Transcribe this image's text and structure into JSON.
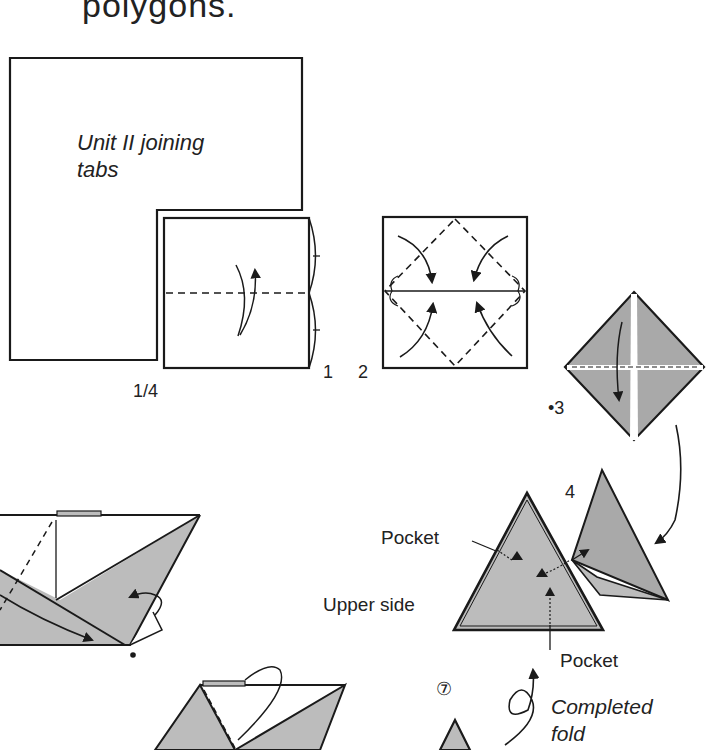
{
  "header": {
    "title_fragment": "polygons."
  },
  "steps": [
    {
      "id": "1/4",
      "label": "1/4"
    },
    {
      "id": "1",
      "label": "1"
    },
    {
      "id": "2",
      "label": "2"
    },
    {
      "id": "3",
      "label": "•3"
    },
    {
      "id": "4",
      "label": "4"
    },
    {
      "id": "7",
      "label": "⑦"
    }
  ],
  "annotations": {
    "unit_label_line1": "Unit II joining",
    "unit_label_line2": "tabs",
    "pocket_top": "Pocket",
    "upper_side": "Upper side",
    "pocket_bottom": "Pocket",
    "completed_line1": "Completed",
    "completed_line2": "fold"
  },
  "colors": {
    "line": "#1a1a1a",
    "paper_shade": "#bcbcbc",
    "paper_shade_dark": "#a9a9a9",
    "background": "#ffffff"
  }
}
